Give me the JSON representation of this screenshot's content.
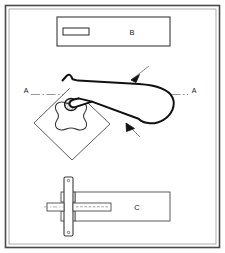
{
  "figure": {
    "border": {
      "outer_color": "#4a4a4a",
      "inner_color": "#8c8c8c",
      "background": "#ffffff"
    },
    "line_color": "#1a1a1a",
    "thin_line_color": "#6e6e6e",
    "centerline_color": "#8a8a8a"
  },
  "views": {
    "top_view": {
      "label": "B",
      "name": "upper-rectangle-view",
      "inner_slot_present": true
    },
    "middle_view": {
      "name": "plan-view-with-paddle",
      "section_label_left": "A",
      "section_label_right": "A",
      "diamond_name": "rotated-square-plate",
      "clover_name": "four-lobe-cam",
      "pivot_name": "hatched-pivot-boss",
      "leader_arrow_count": 2
    },
    "bottom_view": {
      "label": "C",
      "name": "side-elevation-view",
      "flange_name": "vertical-flange-plate",
      "shaft_name": "horizontal-shaft"
    }
  },
  "annotations": {
    "arrow_upper": "leader-arrow-upper",
    "arrow_lower": "leader-arrow-lower"
  }
}
